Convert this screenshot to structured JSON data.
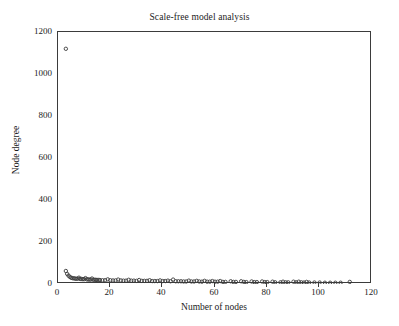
{
  "chart_data": {
    "type": "scatter",
    "title": "Scale-free model analysis",
    "xlabel": "Number of nodes",
    "ylabel": "Node degree",
    "xlim": [
      0,
      120
    ],
    "ylim": [
      0,
      1200
    ],
    "xticks": [
      0,
      20,
      40,
      60,
      80,
      100,
      120
    ],
    "yticks": [
      0,
      200,
      400,
      600,
      800,
      1000,
      1200
    ],
    "grid": false,
    "legend": null,
    "marker": "open-circle",
    "marker_color": "#3b3b3b",
    "series": [
      {
        "name": "Node degree vs number of nodes",
        "points": [
          [
            3,
            1120
          ],
          [
            3,
            62
          ],
          [
            3.5,
            48
          ],
          [
            4,
            40
          ],
          [
            4.5,
            34
          ],
          [
            5,
            30
          ],
          [
            5.5,
            28
          ],
          [
            6,
            27
          ],
          [
            6.5,
            26
          ],
          [
            7,
            25
          ],
          [
            7.5,
            25
          ],
          [
            8,
            30
          ],
          [
            8.5,
            24
          ],
          [
            9,
            24
          ],
          [
            9.5,
            23
          ],
          [
            10,
            23
          ],
          [
            10.5,
            28
          ],
          [
            11,
            22
          ],
          [
            11.5,
            22
          ],
          [
            12,
            21
          ],
          [
            12.5,
            21
          ],
          [
            13,
            26
          ],
          [
            13.5,
            20
          ],
          [
            14,
            20
          ],
          [
            14.5,
            20
          ],
          [
            15,
            19
          ],
          [
            15.5,
            19
          ],
          [
            16,
            19
          ],
          [
            17,
            18
          ],
          [
            18,
            18
          ],
          [
            19,
            22
          ],
          [
            20,
            18
          ],
          [
            21,
            17
          ],
          [
            22,
            17
          ],
          [
            23,
            21
          ],
          [
            24,
            17
          ],
          [
            25,
            16
          ],
          [
            26,
            16
          ],
          [
            27,
            20
          ],
          [
            28,
            16
          ],
          [
            29,
            16
          ],
          [
            30,
            15
          ],
          [
            31,
            19
          ],
          [
            32,
            15
          ],
          [
            33,
            15
          ],
          [
            34,
            15
          ],
          [
            35,
            18
          ],
          [
            36,
            14
          ],
          [
            37,
            14
          ],
          [
            38,
            14
          ],
          [
            39,
            17
          ],
          [
            40,
            14
          ],
          [
            41,
            14
          ],
          [
            42,
            16
          ],
          [
            43,
            13
          ],
          [
            44,
            21
          ],
          [
            45,
            13
          ],
          [
            46,
            13
          ],
          [
            47,
            13
          ],
          [
            48,
            12
          ],
          [
            49,
            12
          ],
          [
            50,
            16
          ],
          [
            51,
            12
          ],
          [
            52,
            12
          ],
          [
            53,
            15
          ],
          [
            54,
            12
          ],
          [
            55,
            11
          ],
          [
            56,
            15
          ],
          [
            57,
            11
          ],
          [
            58,
            11
          ],
          [
            59,
            14
          ],
          [
            60,
            11
          ],
          [
            61,
            11
          ],
          [
            62,
            14
          ],
          [
            63,
            10
          ],
          [
            64,
            10
          ],
          [
            66,
            13
          ],
          [
            67,
            10
          ],
          [
            68,
            10
          ],
          [
            70,
            13
          ],
          [
            71,
            10
          ],
          [
            72,
            9
          ],
          [
            74,
            12
          ],
          [
            75,
            9
          ],
          [
            76,
            9
          ],
          [
            78,
            12
          ],
          [
            79,
            9
          ],
          [
            80,
            9
          ],
          [
            82,
            11
          ],
          [
            83,
            8
          ],
          [
            85,
            8
          ],
          [
            86,
            11
          ],
          [
            87,
            8
          ],
          [
            88,
            8
          ],
          [
            90,
            11
          ],
          [
            91,
            8
          ],
          [
            92,
            11
          ],
          [
            93,
            8
          ],
          [
            94,
            7
          ],
          [
            95,
            10
          ],
          [
            96,
            7
          ],
          [
            98,
            7
          ],
          [
            100,
            7
          ],
          [
            102,
            6
          ],
          [
            104,
            6
          ],
          [
            106,
            6
          ],
          [
            108,
            6
          ],
          [
            111.5,
            10
          ]
        ]
      }
    ]
  }
}
